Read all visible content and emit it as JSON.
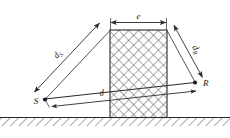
{
  "figure": {
    "type": "technical-diagram",
    "background_color": "#ffffff",
    "line_color": "#2b2b2b",
    "hatch_color": "#555555"
  },
  "labels": {
    "source_point": "S",
    "receiver_point": "R",
    "source_path": "d",
    "source_path_sub": "S",
    "receiver_path": "d",
    "receiver_path_sub": "R",
    "direct_path": "d",
    "barrier_thickness": "e"
  },
  "elements": {
    "ground_name": "ground-line",
    "barrier_name": "barrier-block",
    "hatch_ground": "diagonal-hatch",
    "hatch_barrier": "cross-hatch"
  },
  "geometry": {
    "width": 230,
    "height": 138,
    "ground_y": 117,
    "barrier_left": 110,
    "barrier_right": 167,
    "barrier_top": 30,
    "source": {
      "x": 43,
      "y": 100
    },
    "receiver": {
      "x": 196,
      "y": 83
    },
    "dim_e_y": 22
  }
}
